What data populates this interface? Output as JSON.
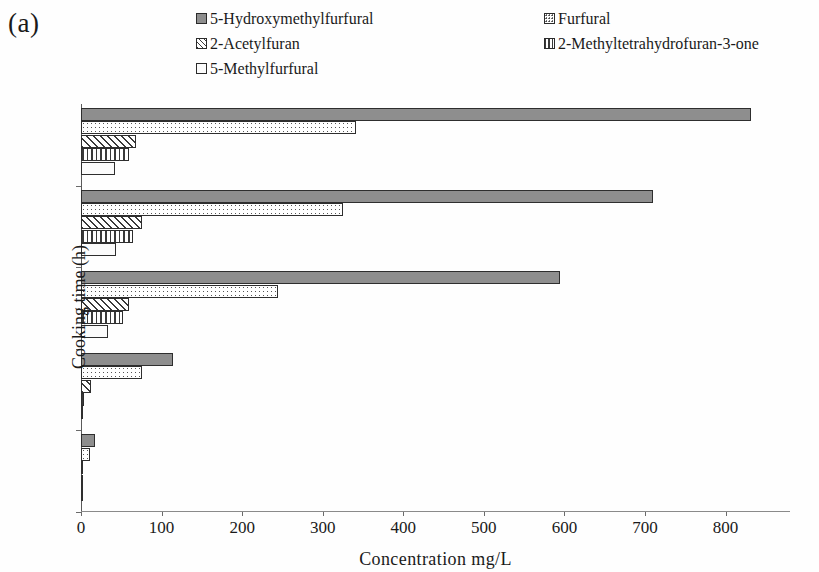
{
  "panel": {
    "label": "(a)"
  },
  "legend": {
    "left_column": [
      {
        "label": "5-Hydroxymethylfurfural",
        "pattern": "solid",
        "swatch_color": "#8e8e8e"
      },
      {
        "label": "2-Acetylfuran",
        "pattern": "diag",
        "swatch_color": "#ffffff"
      },
      {
        "label": "5-Methylfurfural",
        "pattern": "empty",
        "swatch_color": "#fbfbfb"
      }
    ],
    "right_column": [
      {
        "label": "Furfural",
        "pattern": "dots",
        "swatch_color": "#ffffff"
      },
      {
        "label": "2-Methyltetrahydrofuran-3-one",
        "pattern": "vert",
        "swatch_color": "#ffffff"
      }
    ]
  },
  "axes": {
    "y_title": "Cooking time (h)",
    "x_title": "Concentration  mg/L",
    "x_ticks": [
      "0",
      "100",
      "200",
      "300",
      "400",
      "500",
      "600",
      "700",
      "800"
    ],
    "y_ticks": [
      "8.5",
      "7",
      "5.5",
      "4",
      "2.5"
    ]
  },
  "chart_data": {
    "type": "bar",
    "orientation": "horizontal",
    "title": "(a)",
    "xlabel": "Concentration  mg/L",
    "ylabel": "Cooking time (h)",
    "xlim": [
      0,
      880
    ],
    "grid": false,
    "legend_position": "top",
    "categories": [
      "2.5",
      "4",
      "5.5",
      "7",
      "8.5"
    ],
    "category_order_top_to_bottom": [
      "8.5",
      "7",
      "5.5",
      "4",
      "2.5"
    ],
    "series": [
      {
        "name": "5-Hydroxymethylfurfural",
        "pattern": "solid",
        "color": "#8e8e8e",
        "values": [
          17,
          114,
          595,
          710,
          832
        ]
      },
      {
        "name": "Furfural",
        "pattern": "dots",
        "color": "#ffffff",
        "values": [
          11,
          76,
          245,
          325,
          341
        ]
      },
      {
        "name": "2-Acetylfuran",
        "pattern": "diag",
        "color": "#ffffff",
        "values": [
          1,
          13,
          60,
          76,
          68
        ]
      },
      {
        "name": "2-Methyltetrahydrofuran-3-one",
        "pattern": "vert",
        "color": "#ffffff",
        "values": [
          0.5,
          4,
          52,
          64,
          59
        ]
      },
      {
        "name": "5-Methylfurfural",
        "pattern": "empty",
        "color": "#fbfbfb",
        "values": [
          0.5,
          3,
          33,
          43,
          42
        ]
      }
    ]
  }
}
